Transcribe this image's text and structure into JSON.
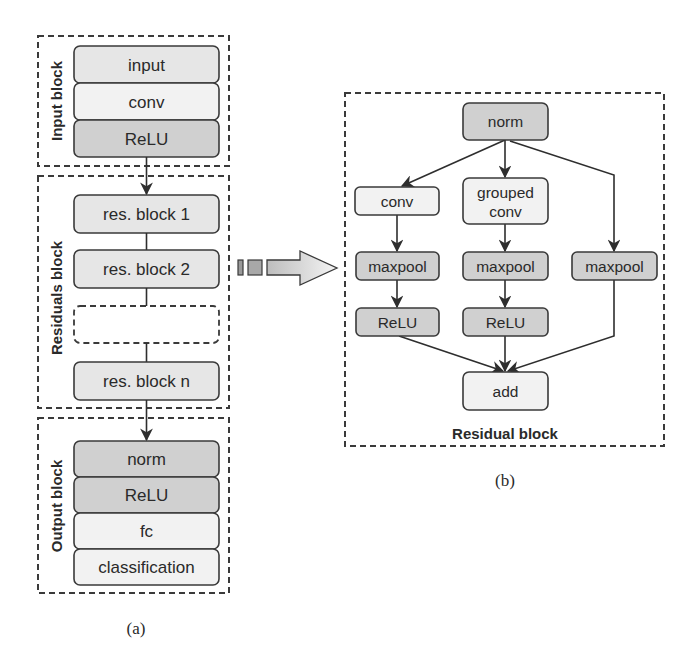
{
  "figure": {
    "panel_a": {
      "caption": "(a)",
      "input_block": {
        "label": "Input block",
        "layers": [
          {
            "label": "input",
            "shade": "mid"
          },
          {
            "label": "conv",
            "shade": "light"
          },
          {
            "label": "ReLU",
            "shade": "dark"
          }
        ]
      },
      "residuals_block": {
        "label": "Residuals block",
        "items": [
          {
            "label": "res. block 1"
          },
          {
            "label": "res. block 2"
          },
          {
            "label": ""
          },
          {
            "label": "res. block n"
          }
        ]
      },
      "output_block": {
        "label": "Output block",
        "layers": [
          {
            "label": "norm",
            "shade": "dark"
          },
          {
            "label": "ReLU",
            "shade": "dark"
          },
          {
            "label": "fc",
            "shade": "light"
          },
          {
            "label": "classification",
            "shade": "light"
          }
        ]
      }
    },
    "expand_arrow": {
      "meaning": "expands to"
    },
    "panel_b": {
      "caption": "(b)",
      "title": "Residual block",
      "nodes": {
        "norm": "norm",
        "conv": "conv",
        "grouped_conv_line1": "grouped",
        "grouped_conv_line2": "conv",
        "maxpool_1": "maxpool",
        "maxpool_2": "maxpool",
        "maxpool_3": "maxpool",
        "relu_1": "ReLU",
        "relu_2": "ReLU",
        "add": "add"
      },
      "edges": [
        [
          "norm",
          "conv"
        ],
        [
          "norm",
          "grouped conv"
        ],
        [
          "norm",
          "maxpool_3"
        ],
        [
          "conv",
          "maxpool_1"
        ],
        [
          "grouped conv",
          "maxpool_2"
        ],
        [
          "maxpool_1",
          "relu_1"
        ],
        [
          "maxpool_2",
          "relu_2"
        ],
        [
          "relu_1",
          "add"
        ],
        [
          "relu_2",
          "add"
        ],
        [
          "maxpool_3",
          "add"
        ]
      ]
    },
    "colors": {
      "light_fill": "#f2f2f2",
      "mid_fill": "#e6e6e6",
      "dark_fill": "#d0d0d0",
      "stroke": "#3a3a3a"
    }
  }
}
